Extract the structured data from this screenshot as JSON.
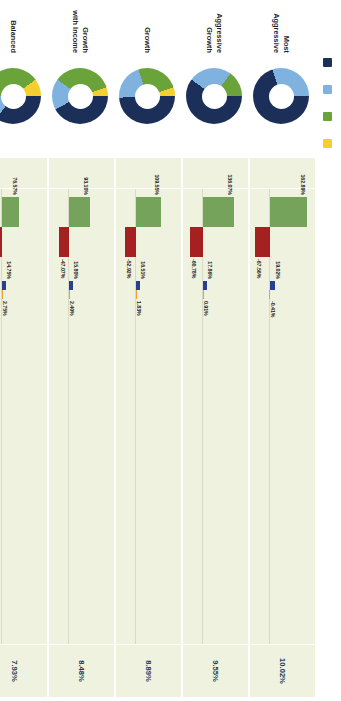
{
  "asset_legend": {
    "items": [
      {
        "label": "Domestic Stocks",
        "color": "#1b2f59"
      },
      {
        "label": "Foreign Stocks",
        "color": "#7fb2de"
      },
      {
        "label": "Bonds",
        "color": "#6aa33a"
      },
      {
        "label": "Short Term",
        "color": "#f5cf2e"
      }
    ]
  },
  "return_legend": {
    "items": [
      {
        "label": "Highest One-Year Return",
        "color": "#76a35b"
      },
      {
        "label": "Lowest One-Year Return",
        "color": "#a52121"
      },
      {
        "label": "Highest Fifteen-Year Return",
        "color": "#2b3f8c"
      },
      {
        "label": "Lowest Fifteen-Year Return",
        "color": "#eea32c"
      }
    ]
  },
  "axis": {
    "ticks": [
      "200%",
      "150%",
      "100%",
      "50%",
      "0%",
      "-50%",
      "-100%"
    ],
    "avg_header": "Average Annual Return:"
  },
  "chart_data": {
    "type": "bar",
    "ylabel": "Return",
    "ylim": [
      -100,
      200
    ],
    "grid": false,
    "legend_position": "bottom",
    "categories": [
      "Most Aggressive",
      "Aggressive Growth",
      "Growth",
      "Growth with Income",
      "Balanced",
      "Moderate",
      "Moderate with Income",
      "Conservative",
      "Short-Term"
    ],
    "series": [
      {
        "name": "Highest One-Year Return",
        "color": "#76a35b",
        "values": [
          162.89,
          136.07,
          109.55,
          93.1,
          76.57,
          60.79,
          45.78,
          31.06,
          15.2
        ]
      },
      {
        "name": "Lowest One-Year Return",
        "color": "#a52121",
        "values": [
          -67.56,
          -60.78,
          -52.92,
          -47.07,
          -40.64,
          -33.62,
          -25.99,
          -17.67,
          -0.04
        ]
      },
      {
        "name": "Highest Fifteen-Year Return",
        "color": "#2b3f8c",
        "values": [
          19.02,
          17.86,
          16.51,
          15.8,
          14.75,
          13.72,
          12.69,
          11.54,
          8.33
        ]
      },
      {
        "name": "Lowest Fifteen-Year Return",
        "color": "#eea32c",
        "values": [
          -0.41,
          0.91,
          1.83,
          2.4,
          2.75,
          2.96,
          3.07,
          2.96,
          0.21
        ]
      }
    ],
    "average_annual_return": [
      10.02,
      9.55,
      8.89,
      8.48,
      7.93,
      7.35,
      6.73,
      5.99,
      3.42
    ]
  },
  "portfolios": [
    {
      "name": "Most Aggressive",
      "name_lines": [
        "Most",
        "Aggressive"
      ],
      "allocation": {
        "domestic": 70,
        "foreign": 30,
        "bonds": 0,
        "short": 0
      },
      "bars": {
        "high_one": "162.89%",
        "low_one": "-67.56%",
        "high_fifteen": "19.02%",
        "low_fifteen": "-0.41%"
      },
      "avg": "10.02%"
    },
    {
      "name": "Aggressive Growth",
      "name_lines": [
        "Aggressive",
        "Growth"
      ],
      "allocation": {
        "domestic": 60,
        "foreign": 25,
        "bonds": 15,
        "short": 0
      },
      "bars": {
        "high_one": "136.07%",
        "low_one": "-60.78%",
        "high_fifteen": "17.86%",
        "low_fifteen": "0.91%"
      },
      "avg": "9.55%"
    },
    {
      "name": "Growth",
      "name_lines": [
        "Growth"
      ],
      "allocation": {
        "domestic": 49,
        "foreign": 21,
        "bonds": 25,
        "short": 5
      },
      "bars": {
        "high_one": "109.55%",
        "low_one": "-52.92%",
        "high_fifteen": "16.51%",
        "low_fifteen": "1.83%"
      },
      "avg": "8.89%"
    },
    {
      "name": "Growth with Income",
      "name_lines": [
        "Growth",
        "with Income"
      ],
      "allocation": {
        "domestic": 42,
        "foreign": 18,
        "bonds": 35,
        "short": 5
      },
      "bars": {
        "high_one": "93.10%",
        "low_one": "-47.07%",
        "high_fifteen": "15.80%",
        "low_fifteen": "2.40%"
      },
      "avg": "8.48%"
    },
    {
      "name": "Balanced",
      "name_lines": [
        "Balanced"
      ],
      "allocation": {
        "domestic": 35,
        "foreign": 15,
        "bonds": 40,
        "short": 10
      },
      "bars": {
        "high_one": "76.57%",
        "low_one": "-40.64%",
        "high_fifteen": "14.75%",
        "low_fifteen": "2.75%"
      },
      "avg": "7.93%"
    },
    {
      "name": "Moderate",
      "name_lines": [
        "Moderate"
      ],
      "allocation": {
        "domestic": 28,
        "foreign": 12,
        "bonds": 45,
        "short": 15
      },
      "bars": {
        "high_one": "60.79%",
        "low_one": "-33.62%",
        "high_fifteen": "13.72%",
        "low_fifteen": "2.96%"
      },
      "avg": "7.35%"
    },
    {
      "name": "Moderate with Income",
      "name_lines": [
        "Moderate",
        "with Income"
      ],
      "allocation": {
        "domestic": 21,
        "foreign": 9,
        "bonds": 50,
        "short": 20
      },
      "bars": {
        "high_one": "45.78%",
        "low_one": "-25.99%",
        "high_fifteen": "12.69%",
        "low_fifteen": "3.07%"
      },
      "avg": "6.73%"
    },
    {
      "name": "Conservative",
      "name_lines": [
        "Conservative"
      ],
      "allocation": {
        "domestic": 14,
        "foreign": 6,
        "bonds": 50,
        "short": 30
      },
      "bars": {
        "high_one": "31.06%",
        "low_one": "-17.67%",
        "high_fifteen": "11.54%",
        "low_fifteen": "2.96%"
      },
      "avg": "5.99%"
    },
    {
      "name": "Short-Term",
      "name_lines": [
        "Short-Term"
      ],
      "allocation": {
        "domestic": 0,
        "foreign": 0,
        "bonds": 0,
        "short": 100
      },
      "bars": {
        "high_one": "15.20%",
        "low_one": "-0.04%",
        "high_fifteen": "8.33%",
        "low_fifteen": "0.21%"
      },
      "avg": "3.42%"
    }
  ]
}
